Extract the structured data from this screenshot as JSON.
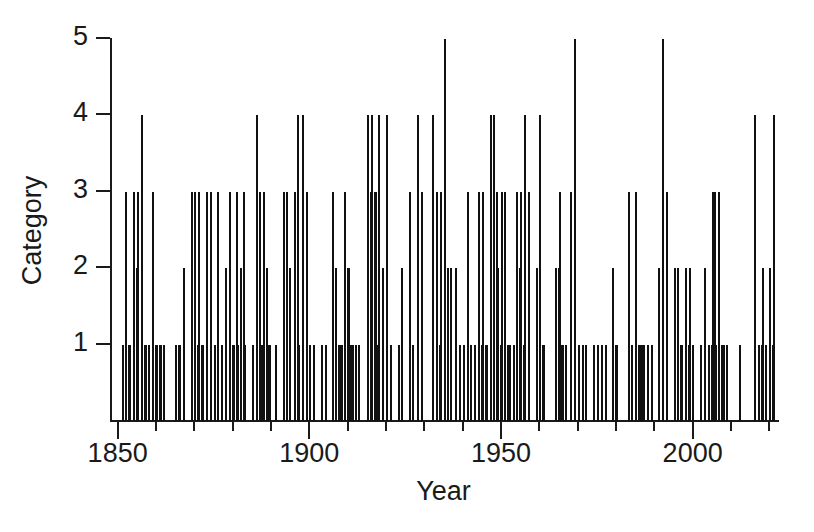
{
  "chart_data": {
    "type": "bar",
    "title": "",
    "xlabel": "Year",
    "ylabel": "Category",
    "xlim": [
      1848,
      2022
    ],
    "ylim": [
      0,
      5
    ],
    "grid": false,
    "legend": null,
    "x_ticks": [
      1850,
      1900,
      1950,
      2000
    ],
    "x_tick_labels": [
      "1850",
      "1900",
      "1950",
      "2000"
    ],
    "x_minor_tick_step": 10,
    "y_ticks": [
      1,
      2,
      3,
      4,
      5
    ],
    "y_tick_labels": [
      "1",
      "2",
      "3",
      "4",
      "5"
    ],
    "bar_color": "#111111",
    "x": [
      1851,
      1852,
      1852,
      1853,
      1854,
      1854,
      1855,
      1856,
      1856,
      1857,
      1858,
      1859,
      1859,
      1860,
      1860,
      1861,
      1861,
      1865,
      1865,
      1866,
      1867,
      1869,
      1869,
      1870,
      1870,
      1871,
      1871,
      1872,
      1873,
      1874,
      1875,
      1876,
      1877,
      1878,
      1879,
      1879,
      1880,
      1880,
      1881,
      1881,
      1882,
      1882,
      1883,
      1885,
      1886,
      1886,
      1886,
      1887,
      1888,
      1888,
      1888,
      1889,
      1891,
      1893,
      1893,
      1893,
      1894,
      1894,
      1896,
      1896,
      1897,
      1898,
      1899,
      1899,
      1900,
      1901,
      1903,
      1904,
      1906,
      1906,
      1906,
      1906,
      1908,
      1909,
      1909,
      1909,
      1910,
      1911,
      1912,
      1912,
      1915,
      1915,
      1916,
      1916,
      1916,
      1917,
      1918,
      1919,
      1920,
      1921,
      1923,
      1924,
      1926,
      1926,
      1928,
      1929,
      1932,
      1933,
      1933,
      1934,
      1935,
      1935,
      1936,
      1936,
      1938,
      1939,
      1940,
      1941,
      1941,
      1942,
      1943,
      1944,
      1944,
      1945,
      1945,
      1946,
      1947,
      1947,
      1948,
      1948,
      1949,
      1949,
      1950,
      1950,
      1950,
      1952,
      1953,
      1954,
      1954,
      1955,
      1955,
      1956,
      1957,
      1959,
      1960,
      1960,
      1961,
      1964,
      1964,
      1964,
      1965,
      1966,
      1966,
      1968,
      1969,
      1970,
      1971,
      1972,
      1974,
      1975,
      1976,
      1977,
      1979,
      1979,
      1980,
      1983,
      1984,
      1985,
      1985,
      1985,
      1986,
      1987,
      1988,
      1989,
      1991,
      1992,
      1993,
      1995,
      1995,
      1996,
      1996,
      1997,
      1998,
      1998,
      1999,
      1999,
      2002,
      2003,
      2004,
      2004,
      2004,
      2005,
      2005,
      2005,
      2005,
      2008,
      2008,
      2012,
      2016,
      2017,
      2017,
      2018,
      2018,
      2020,
      2020,
      2021
    ],
    "values": [
      1,
      3,
      1,
      1,
      3,
      2,
      3,
      4,
      1,
      1,
      1,
      3,
      1,
      1,
      1,
      1,
      1,
      1,
      1,
      1,
      2,
      3,
      1,
      3,
      1,
      3,
      1,
      1,
      3,
      3,
      1,
      3,
      1,
      2,
      3,
      1,
      1,
      3,
      1,
      2,
      1,
      3,
      1,
      1,
      4,
      3,
      1,
      1,
      3,
      2,
      1,
      1,
      1,
      3,
      1,
      2,
      3,
      1,
      3,
      4,
      1,
      4,
      3,
      1,
      1,
      1,
      1,
      1,
      3,
      2,
      1,
      1,
      1,
      3,
      2,
      1,
      2,
      1,
      1,
      1,
      4,
      3,
      4,
      3,
      1,
      3,
      4,
      2,
      4,
      1,
      1,
      2,
      3,
      1,
      4,
      3,
      4,
      3,
      1,
      3,
      5,
      2,
      1,
      2,
      2,
      1,
      1,
      3,
      1,
      1,
      1,
      3,
      1,
      3,
      1,
      1,
      4,
      1,
      4,
      3,
      2,
      1,
      3,
      3,
      1,
      1,
      1,
      3,
      2,
      3,
      1,
      4,
      3,
      2,
      4,
      1,
      1,
      2,
      2,
      1,
      3,
      1,
      1,
      3,
      5,
      1,
      1,
      1,
      1,
      1,
      1,
      1,
      2,
      1,
      1,
      3,
      1,
      3,
      1,
      1,
      1,
      1,
      1,
      1,
      2,
      5,
      3,
      2,
      1,
      2,
      1,
      1,
      2,
      1,
      2,
      1,
      1,
      2,
      1,
      1,
      3,
      3,
      1,
      3,
      1,
      1,
      1,
      1,
      4,
      1,
      1,
      2,
      1,
      2,
      1,
      4
    ]
  },
  "axes": {
    "ylabel_text": "Category",
    "xlabel_text": "Year"
  }
}
